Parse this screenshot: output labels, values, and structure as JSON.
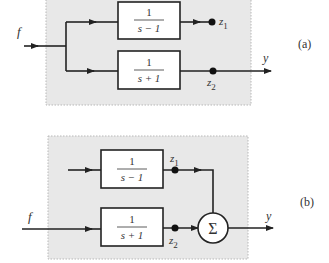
{
  "diagrams": [
    {
      "id": "a",
      "label": "(a)",
      "input": "f",
      "output": "y",
      "blocks": [
        {
          "num": "1",
          "den": "s − 1"
        },
        {
          "num": "1",
          "den": "s + 1"
        }
      ],
      "nodes": [
        {
          "name": "z",
          "sub": "1"
        },
        {
          "name": "z",
          "sub": "2"
        }
      ]
    },
    {
      "id": "b",
      "label": "(b)",
      "input": "f",
      "output": "y",
      "blocks": [
        {
          "num": "1",
          "den": "s − 1"
        },
        {
          "num": "1",
          "den": "s + 1"
        }
      ],
      "nodes": [
        {
          "name": "z",
          "sub": "1"
        },
        {
          "name": "z",
          "sub": "2"
        }
      ],
      "summer": "Σ"
    }
  ],
  "colors": {
    "panel": "#e8e8e8",
    "line": "#222222"
  }
}
